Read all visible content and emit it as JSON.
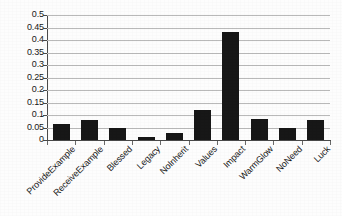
{
  "chart_data": {
    "type": "bar",
    "title": "",
    "xlabel": "",
    "ylabel": "",
    "ylim": [
      0,
      0.5
    ],
    "grid": true,
    "legend": "none",
    "y_ticks": [
      "0",
      "0.05",
      "0.1",
      "0.15",
      "0.2",
      "0.25",
      "0.3",
      "0.35",
      "0.4",
      "0.45",
      "0.5"
    ],
    "y_tick_values": [
      0,
      0.05,
      0.1,
      0.15,
      0.2,
      0.25,
      0.3,
      0.35,
      0.4,
      0.45,
      0.5
    ],
    "categories": [
      "ProvideExample",
      "ReceiveExample",
      "Blessed",
      "Legacy",
      "NoInherit",
      "Values",
      "Impact",
      "WarmGlow",
      "NoNeed",
      "Luck"
    ],
    "values": [
      0.065,
      0.079,
      0.048,
      0.011,
      0.028,
      0.121,
      0.432,
      0.085,
      0.05,
      0.081
    ],
    "series": [
      {
        "name": "",
        "values": [
          0.065,
          0.079,
          0.048,
          0.011,
          0.028,
          0.121,
          0.432,
          0.085,
          0.05,
          0.081
        ]
      }
    ],
    "bar_color": "#171717",
    "grid_color": "#b9b9b9",
    "axis_color": "#4a4a4a",
    "background_color": "#fdfdfd"
  }
}
